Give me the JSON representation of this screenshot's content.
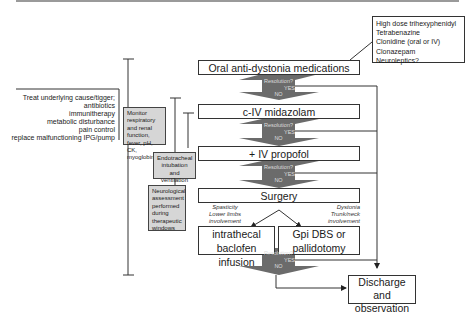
{
  "header": {
    "rule": "top-border"
  },
  "side_meds": {
    "items": [
      "High dose trihexyphenidyl",
      "Tetrabenazine",
      "Clonidine (oral or IV)",
      "Clonazepam",
      "Neuroleptics?"
    ]
  },
  "steps": {
    "oral": "Oral anti-dystonia medications",
    "midazolam": "c-IV midazolam",
    "propofol": "+ IV propofol",
    "surgery": "Surgery",
    "baclofen": "intrathecal baclofen infusion",
    "gpi": "Gpi DBS or pallidotomy",
    "discharge": "Discharge and observation"
  },
  "decision": {
    "question": "Resolution?",
    "yes": "YES",
    "no": "NO"
  },
  "branches": {
    "left": [
      "Spasticity",
      "Lower limbs",
      "involvement"
    ],
    "right": [
      "Dystonia",
      "Trunk/neck",
      "involvement"
    ]
  },
  "treat": {
    "items": [
      "Treat underlying cause/tigger;",
      "antibiotics",
      "immunitherapy",
      "metabolic disturbance",
      "pain control",
      "replace malfunctioning IPG/pump"
    ]
  },
  "support": {
    "monitor": "Monitor respiratory and renal function, fever, pH, CK, myoglobinuria",
    "intubation": "Endotracheal intubation and ventilation",
    "neuro": "Neurological assessment performed during therapeutic windows"
  },
  "colors": {
    "arrow": "#6b6b6b",
    "gray_box": "#d6d6d6",
    "line": "#333333"
  }
}
